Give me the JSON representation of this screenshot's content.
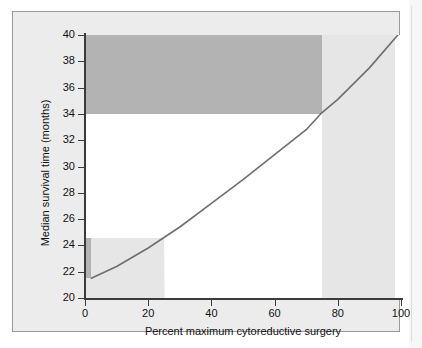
{
  "figure": {
    "background": "#ececec",
    "plot_background": "#ffffff",
    "border_color": "#9a9a9a"
  },
  "chart_data": {
    "type": "line",
    "title": "",
    "subtitle": "",
    "xlabel": "Percent maximum cytoreductive surgery",
    "ylabel": "Median survival time (months)",
    "xlim": [
      0,
      100
    ],
    "ylim": [
      20,
      40
    ],
    "xticks": [
      0,
      20,
      40,
      60,
      80,
      100
    ],
    "yticks": [
      20,
      22,
      24,
      26,
      28,
      30,
      32,
      34,
      36,
      38,
      40
    ],
    "xticklabels": [
      "0",
      "20",
      "40",
      "60",
      "80",
      "100"
    ],
    "yticklabels": [
      "20",
      "22",
      "24",
      "26",
      "28",
      "30",
      "32",
      "34",
      "36",
      "38",
      "40"
    ],
    "grid": false,
    "legend": null,
    "series": [
      {
        "name": "Median survival time",
        "color": "#6e6e6e",
        "x": [
          2,
          10,
          20,
          25,
          30,
          40,
          50,
          60,
          70,
          75,
          80,
          90,
          99
        ],
        "y": [
          21.5,
          22.4,
          23.8,
          24.6,
          25.4,
          27.2,
          29.0,
          30.9,
          32.8,
          34.1,
          35.1,
          37.5,
          40.0
        ]
      }
    ],
    "shaded_regions": [
      {
        "name": "upper-dark-band",
        "color": "#b3b3b3",
        "x_range": [
          0,
          75
        ],
        "y_range": [
          34,
          40
        ]
      },
      {
        "name": "lower-left-dark-region",
        "color": "#b3b3b3",
        "x_range": [
          0,
          25
        ],
        "y_range": [
          21.5,
          24.6
        ]
      },
      {
        "name": "left-light-band",
        "color": "#e6e6e6",
        "x_range": [
          2,
          25
        ],
        "y_range": [
          20,
          24.6
        ]
      },
      {
        "name": "right-light-band",
        "color": "#e6e6e6",
        "x_range": [
          75,
          98
        ],
        "y_range": [
          20,
          40
        ]
      }
    ]
  }
}
